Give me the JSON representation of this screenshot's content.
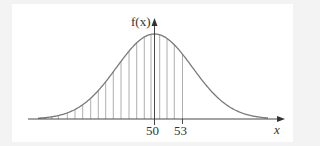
{
  "chart_data": {
    "type": "line",
    "title": "",
    "xlabel": "x",
    "ylabel": "f(x)",
    "tick_labels": [
      "50",
      "53"
    ],
    "mean": 50,
    "shaded_upper_bound": 53,
    "shading": "vertical-hatching",
    "grid": false,
    "legend": null
  },
  "labels": {
    "y_axis": "f(x)",
    "x_axis": "x",
    "tick_50": "50",
    "tick_53": "53"
  },
  "colors": {
    "curve": "#7a7a7a",
    "axis": "#333333",
    "hatch": "#9a9a9a",
    "background": "#f3f3f3",
    "panel": "#ffffff"
  }
}
